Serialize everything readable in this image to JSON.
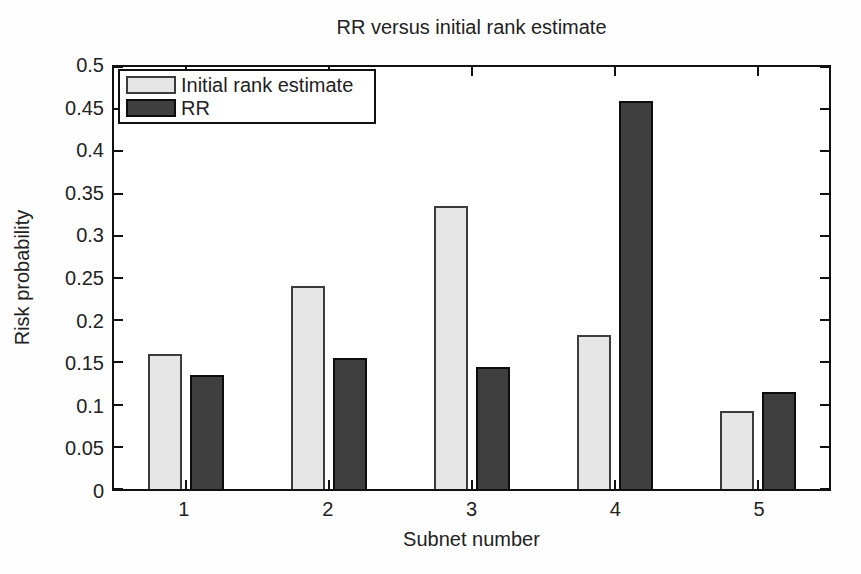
{
  "figure": {
    "title": "RR versus initial rank estimate",
    "xlabel": "Subnet number",
    "ylabel": "Risk probability"
  },
  "legend": {
    "position": "upper-left-inside",
    "items": [
      {
        "label": "Initial rank estimate",
        "swatch": "light-gray-dotted-bar"
      },
      {
        "label": "RR",
        "swatch": "dark-gray-dotted-bar"
      }
    ]
  },
  "colors": {
    "bar_light_fill": "#e6e6e6",
    "bar_light_dot": "#cacaca",
    "bar_light_border": "#3c3c3c",
    "bar_dark_fill": "#3f3f3f",
    "bar_dark_dot": "#5d5d5d",
    "bar_dark_border": "#0d0d0d",
    "axis": "#111111",
    "background": "#ffffff"
  },
  "chart_data": {
    "type": "bar",
    "title": "RR versus initial rank estimate",
    "xlabel": "Subnet number",
    "ylabel": "Risk probability",
    "categories": [
      "1",
      "2",
      "3",
      "4",
      "5"
    ],
    "series": [
      {
        "name": "Initial rank estimate",
        "values": [
          0.16,
          0.24,
          0.335,
          0.183,
          0.093
        ]
      },
      {
        "name": "RR",
        "values": [
          0.135,
          0.155,
          0.144,
          0.46,
          0.115
        ]
      }
    ],
    "ylim": [
      0,
      0.5
    ],
    "yticks": [
      {
        "v": 0,
        "label": "0"
      },
      {
        "v": 0.05,
        "label": "0.05"
      },
      {
        "v": 0.1,
        "label": "0.1"
      },
      {
        "v": 0.15,
        "label": "0.15"
      },
      {
        "v": 0.2,
        "label": "0.2"
      },
      {
        "v": 0.25,
        "label": "0.25"
      },
      {
        "v": 0.3,
        "label": "0.3"
      },
      {
        "v": 0.35,
        "label": "0.35"
      },
      {
        "v": 0.4,
        "label": "0.4"
      },
      {
        "v": 0.45,
        "label": "0.45"
      },
      {
        "v": 0.5,
        "label": "0.5"
      }
    ],
    "grid": false,
    "legend_position": "upper-left-inside",
    "bar_style": "grouped, box axes with inward ticks on all four sides (MATLAB style)"
  }
}
